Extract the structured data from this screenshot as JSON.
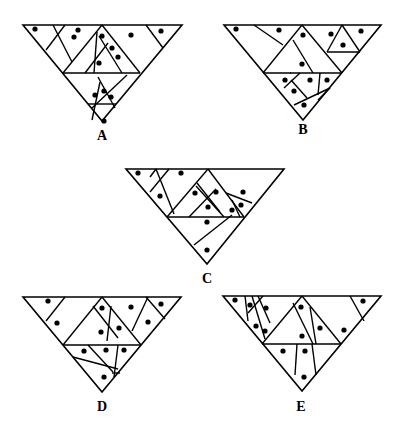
{
  "stroke_color": "#000000",
  "dot_color": "#000000",
  "figures": [
    {
      "label": "A",
      "label_pos": [
        102,
        129
      ],
      "outline": [
        [
          23,
          25
        ],
        [
          182,
          25
        ],
        [
          102,
          121
        ]
      ],
      "lines": [
        [
          [
            63,
            73
          ],
          [
            140,
            73
          ]
        ],
        [
          [
            65,
            25
          ],
          [
            46,
            50
          ]
        ],
        [
          [
            53,
            25
          ],
          [
            72,
            62
          ]
        ],
        [
          [
            102,
            25
          ],
          [
            63,
            73
          ]
        ],
        [
          [
            102,
            25
          ],
          [
            140,
            73
          ]
        ],
        [
          [
            108,
            43
          ],
          [
            85,
            73
          ]
        ],
        [
          [
            97,
            32
          ],
          [
            94,
            73
          ]
        ],
        [
          [
            99,
            36
          ],
          [
            122,
            73
          ]
        ],
        [
          [
            146,
            25
          ],
          [
            163,
            48
          ]
        ],
        [
          [
            127,
            75
          ],
          [
            92,
            108
          ]
        ],
        [
          [
            98,
            77
          ],
          [
            115,
            108
          ]
        ],
        [
          [
            100,
            82
          ],
          [
            92,
            120
          ]
        ],
        [
          [
            88,
            104
          ],
          [
            116,
            104
          ]
        ]
      ],
      "dots": [
        [
          35,
          29
        ],
        [
          78,
          30
        ],
        [
          74,
          37
        ],
        [
          102,
          36
        ],
        [
          131,
          35
        ],
        [
          161,
          31
        ],
        [
          112,
          48
        ],
        [
          118,
          57
        ],
        [
          99,
          63
        ],
        [
          104,
          91
        ],
        [
          95,
          95
        ],
        [
          111,
          97
        ],
        [
          104,
          121
        ]
      ]
    },
    {
      "label": "B",
      "label_pos": [
        303,
        123
      ],
      "outline": [
        [
          224,
          25
        ],
        [
          381,
          25
        ],
        [
          303,
          120
        ]
      ],
      "lines": [
        [
          [
            263,
            73
          ],
          [
            342,
            73
          ]
        ],
        [
          [
            254,
            25
          ],
          [
            283,
            45
          ]
        ],
        [
          [
            302,
            25
          ],
          [
            263,
            73
          ]
        ],
        [
          [
            302,
            25
          ],
          [
            342,
            73
          ]
        ],
        [
          [
            293,
            40
          ],
          [
            313,
            73
          ]
        ],
        [
          [
            342,
            25
          ],
          [
            327,
            52
          ]
        ],
        [
          [
            342,
            25
          ],
          [
            360,
            52
          ]
        ],
        [
          [
            327,
            52
          ],
          [
            360,
            52
          ]
        ],
        [
          [
            291,
            73
          ],
          [
            290,
            73
          ]
        ],
        [
          [
            300,
            73
          ],
          [
            284,
            88
          ]
        ],
        [
          [
            291,
            80
          ],
          [
            307,
            98
          ]
        ],
        [
          [
            320,
            73
          ],
          [
            318,
            95
          ]
        ],
        [
          [
            330,
            88
          ],
          [
            294,
            105
          ]
        ],
        [
          [
            330,
            88
          ],
          [
            318,
            100
          ]
        ]
      ],
      "dots": [
        [
          236,
          29
        ],
        [
          279,
          30
        ],
        [
          303,
          35
        ],
        [
          331,
          34
        ],
        [
          361,
          31
        ],
        [
          343,
          45
        ],
        [
          302,
          64
        ],
        [
          285,
          80
        ],
        [
          310,
          80
        ],
        [
          327,
          80
        ],
        [
          294,
          91
        ],
        [
          304,
          105
        ]
      ]
    },
    {
      "label": "C",
      "label_pos": [
        207,
        272
      ],
      "outline": [
        [
          126,
          169
        ],
        [
          284,
          169
        ],
        [
          207,
          264
        ]
      ],
      "lines": [
        [
          [
            167,
            217
          ],
          [
            244,
            217
          ]
        ],
        [
          [
            156,
            169
          ],
          [
            150,
            177
          ]
        ],
        [
          [
            169,
            169
          ],
          [
            150,
            192
          ]
        ],
        [
          [
            156,
            169
          ],
          [
            174,
            214
          ]
        ],
        [
          [
            208,
            169
          ],
          [
            167,
            217
          ]
        ],
        [
          [
            208,
            169
          ],
          [
            244,
            217
          ]
        ],
        [
          [
            197,
            183
          ],
          [
            220,
            212
          ]
        ],
        [
          [
            216,
            189
          ],
          [
            189,
            217
          ]
        ],
        [
          [
            196,
            186
          ],
          [
            224,
            217
          ]
        ],
        [
          [
            226,
            193
          ],
          [
            252,
            203
          ]
        ],
        [
          [
            232,
            200
          ],
          [
            240,
            217
          ]
        ],
        [
          [
            232,
            215
          ],
          [
            194,
            245
          ]
        ]
      ],
      "dots": [
        [
          138,
          173
        ],
        [
          181,
          173
        ],
        [
          160,
          196
        ],
        [
          195,
          193
        ],
        [
          216,
          192
        ],
        [
          243,
          192
        ],
        [
          241,
          205
        ],
        [
          208,
          207
        ],
        [
          232,
          210
        ],
        [
          207,
          222
        ],
        [
          207,
          250
        ]
      ]
    },
    {
      "label": "D",
      "label_pos": [
        102,
        400
      ],
      "outline": [
        [
          23,
          297
        ],
        [
          181,
          297
        ],
        [
          102,
          392
        ]
      ],
      "lines": [
        [
          [
            63,
            345
          ],
          [
            141,
            345
          ]
        ],
        [
          [
            65,
            297
          ],
          [
            46,
            321
          ]
        ],
        [
          [
            102,
            297
          ],
          [
            63,
            345
          ]
        ],
        [
          [
            102,
            297
          ],
          [
            141,
            345
          ]
        ],
        [
          [
            93,
            306
          ],
          [
            118,
            338
          ]
        ],
        [
          [
            111,
            306
          ],
          [
            107,
            341
          ]
        ],
        [
          [
            148,
            297
          ],
          [
            132,
            331
          ]
        ],
        [
          [
            146,
            297
          ],
          [
            165,
            319
          ]
        ],
        [
          [
            88,
            345
          ],
          [
            113,
            372
          ]
        ],
        [
          [
            118,
            345
          ],
          [
            114,
            377
          ]
        ],
        [
          [
            73,
            357
          ],
          [
            118,
            369
          ]
        ],
        [
          [
            112,
            373
          ],
          [
            120,
            373
          ]
        ]
      ],
      "dots": [
        [
          48,
          301
        ],
        [
          57,
          323
        ],
        [
          102,
          308
        ],
        [
          131,
          307
        ],
        [
          161,
          304
        ],
        [
          148,
          322
        ],
        [
          119,
          328
        ],
        [
          101,
          332
        ],
        [
          84,
          351
        ],
        [
          106,
          350
        ],
        [
          124,
          350
        ],
        [
          104,
          377
        ]
      ]
    },
    {
      "label": "E",
      "label_pos": [
        301,
        400
      ],
      "outline": [
        [
          223,
          296
        ],
        [
          381,
          296
        ],
        [
          302,
          391
        ]
      ],
      "lines": [
        [
          [
            262,
            344
          ],
          [
            341,
            344
          ]
        ],
        [
          [
            245,
            296
          ],
          [
            248,
            321
          ]
        ],
        [
          [
            252,
            296
          ],
          [
            265,
            339
          ]
        ],
        [
          [
            258,
            296
          ],
          [
            270,
            323
          ]
        ],
        [
          [
            263,
            296
          ],
          [
            248,
            313
          ]
        ],
        [
          [
            302,
            296
          ],
          [
            262,
            344
          ]
        ],
        [
          [
            302,
            296
          ],
          [
            341,
            344
          ]
        ],
        [
          [
            293,
            303
          ],
          [
            313,
            344
          ]
        ],
        [
          [
            310,
            307
          ],
          [
            316,
            344
          ]
        ],
        [
          [
            350,
            296
          ],
          [
            364,
            321
          ]
        ],
        [
          [
            297,
            344
          ],
          [
            295,
            375
          ]
        ],
        [
          [
            312,
            344
          ],
          [
            316,
            375
          ]
        ]
      ],
      "dots": [
        [
          235,
          300
        ],
        [
          250,
          305
        ],
        [
          266,
          308
        ],
        [
          256,
          326
        ],
        [
          265,
          331
        ],
        [
          301,
          307
        ],
        [
          320,
          328
        ],
        [
          344,
          330
        ],
        [
          363,
          301
        ],
        [
          302,
          336
        ],
        [
          283,
          351
        ],
        [
          305,
          351
        ],
        [
          304,
          377
        ]
      ]
    }
  ]
}
